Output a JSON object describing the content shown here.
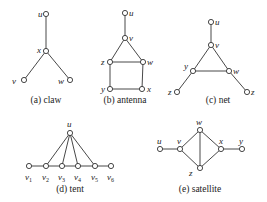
{
  "figure": {
    "panels": [
      {
        "id": "a",
        "caption": "(a) claw",
        "caption_pos": [
          46,
          103
        ],
        "nodes": [
          {
            "id": "u",
            "label": "u",
            "x": 46,
            "y": 14,
            "lx": 38,
            "ly": 17
          },
          {
            "id": "x",
            "label": "x",
            "x": 46,
            "y": 51,
            "lx": 37,
            "ly": 53
          },
          {
            "id": "v",
            "label": "v",
            "x": 24,
            "y": 80,
            "lx": 12,
            "ly": 84
          },
          {
            "id": "w",
            "label": "w",
            "x": 70,
            "y": 80,
            "lx": 58,
            "ly": 84
          }
        ],
        "edges": [
          [
            "u",
            "x"
          ],
          [
            "x",
            "v"
          ],
          [
            "x",
            "w"
          ]
        ]
      },
      {
        "id": "b",
        "caption": "(b) antenna",
        "caption_pos": [
          125,
          103
        ],
        "nodes": [
          {
            "id": "u",
            "label": "u",
            "x": 125,
            "y": 13,
            "lx": 129,
            "ly": 16
          },
          {
            "id": "v",
            "label": "v",
            "x": 125,
            "y": 38,
            "lx": 129,
            "ly": 41
          },
          {
            "id": "z",
            "label": "z",
            "x": 110,
            "y": 62,
            "lx": 101,
            "ly": 65
          },
          {
            "id": "w",
            "label": "w",
            "x": 143,
            "y": 62,
            "lx": 147,
            "ly": 65
          },
          {
            "id": "y",
            "label": "y",
            "x": 110,
            "y": 89,
            "lx": 101,
            "ly": 92
          },
          {
            "id": "x",
            "label": "x",
            "x": 142,
            "y": 89,
            "lx": 147,
            "ly": 92
          }
        ],
        "edges": [
          [
            "u",
            "v"
          ],
          [
            "v",
            "z"
          ],
          [
            "v",
            "w"
          ],
          [
            "z",
            "w"
          ],
          [
            "z",
            "y"
          ],
          [
            "w",
            "x"
          ],
          [
            "y",
            "x"
          ]
        ]
      },
      {
        "id": "c",
        "caption": "(c) net",
        "caption_pos": [
          218,
          103
        ],
        "nodes": [
          {
            "id": "u",
            "label": "u",
            "x": 211,
            "y": 22,
            "lx": 215,
            "ly": 25
          },
          {
            "id": "v",
            "label": "v",
            "x": 211,
            "y": 45,
            "lx": 215,
            "ly": 48
          },
          {
            "id": "y",
            "label": "y",
            "x": 193,
            "y": 71,
            "lx": 184,
            "ly": 69
          },
          {
            "id": "w",
            "label": "w",
            "x": 229,
            "y": 71,
            "lx": 233,
            "ly": 74
          },
          {
            "id": "z1",
            "label": "z",
            "x": 177,
            "y": 92,
            "lx": 168,
            "ly": 95
          },
          {
            "id": "z2",
            "label": "z",
            "x": 247,
            "y": 92,
            "lx": 251,
            "ly": 95
          }
        ],
        "edges": [
          [
            "u",
            "v"
          ],
          [
            "v",
            "y"
          ],
          [
            "v",
            "w"
          ],
          [
            "y",
            "w"
          ],
          [
            "y",
            "z1"
          ],
          [
            "w",
            "z2"
          ]
        ]
      },
      {
        "id": "d",
        "caption": "(d) tent",
        "caption_pos": [
          70,
          192
        ],
        "nodes": [
          {
            "id": "u",
            "label": "u",
            "x": 70,
            "y": 133,
            "lx": 67,
            "ly": 127
          },
          {
            "id": "v1",
            "label": "v",
            "sub": "1",
            "x": 29,
            "y": 166,
            "lx": 25,
            "ly": 180
          },
          {
            "id": "v2",
            "label": "v",
            "sub": "2",
            "x": 46,
            "y": 166,
            "lx": 42,
            "ly": 180
          },
          {
            "id": "v3",
            "label": "v",
            "sub": "3",
            "x": 62,
            "y": 166,
            "lx": 58,
            "ly": 180
          },
          {
            "id": "v4",
            "label": "v",
            "sub": "4",
            "x": 78,
            "y": 166,
            "lx": 74,
            "ly": 180
          },
          {
            "id": "v5",
            "label": "v",
            "sub": "5",
            "x": 95,
            "y": 166,
            "lx": 91,
            "ly": 180
          },
          {
            "id": "v6",
            "label": "v",
            "sub": "6",
            "x": 111,
            "y": 166,
            "lx": 107,
            "ly": 180
          }
        ],
        "edges": [
          [
            "v1",
            "v2"
          ],
          [
            "v2",
            "v3"
          ],
          [
            "v3",
            "v4"
          ],
          [
            "v4",
            "v5"
          ],
          [
            "v5",
            "v6"
          ],
          [
            "u",
            "v2"
          ],
          [
            "u",
            "v3"
          ],
          [
            "u",
            "v4"
          ],
          [
            "u",
            "v5"
          ]
        ]
      },
      {
        "id": "e",
        "caption": "(e) satellite",
        "caption_pos": [
          200,
          192
        ],
        "nodes": [
          {
            "id": "u",
            "label": "u",
            "x": 160,
            "y": 149,
            "lx": 157,
            "ly": 144
          },
          {
            "id": "v",
            "label": "v",
            "x": 180,
            "y": 149,
            "lx": 177,
            "ly": 144
          },
          {
            "id": "w",
            "label": "w",
            "x": 200,
            "y": 130,
            "lx": 196,
            "ly": 125
          },
          {
            "id": "z",
            "label": "z",
            "x": 200,
            "y": 168,
            "lx": 189,
            "ly": 176
          },
          {
            "id": "x",
            "label": "x",
            "x": 221,
            "y": 149,
            "lx": 219,
            "ly": 144
          },
          {
            "id": "y",
            "label": "y",
            "x": 242,
            "y": 149,
            "lx": 239,
            "ly": 144
          }
        ],
        "edges": [
          [
            "u",
            "v"
          ],
          [
            "v",
            "w"
          ],
          [
            "v",
            "z"
          ],
          [
            "w",
            "z"
          ],
          [
            "w",
            "x"
          ],
          [
            "z",
            "x"
          ],
          [
            "x",
            "y"
          ]
        ]
      }
    ],
    "style": {
      "node_radius": 2.6,
      "edge_color": "#333333",
      "node_fill": "#ffffff",
      "background": "#ffffff"
    }
  }
}
